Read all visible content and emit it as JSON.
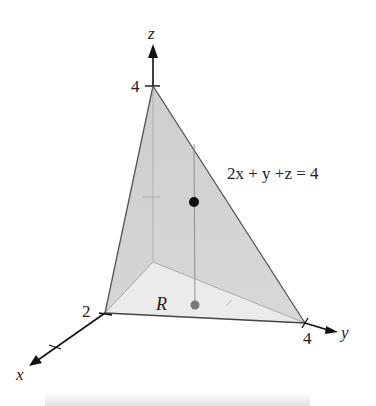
{
  "figure": {
    "type": "3d-solid-region",
    "axes": {
      "x": {
        "label": "x",
        "intercept_label": "2"
      },
      "y": {
        "label": "y",
        "intercept_label": "4"
      },
      "z": {
        "label": "z",
        "intercept_label": "4"
      }
    },
    "plane_equation": "2x + y +z = 4",
    "region_label": "R",
    "points": [
      {
        "name": "point-on-plane",
        "color": "#111111"
      },
      {
        "name": "point-in-region",
        "color": "#777777"
      }
    ],
    "colors": {
      "left_face": "#b5b5b5",
      "front_face": "#d2d2d2",
      "base_region": "#ebebeb",
      "edges": "#555555",
      "axes": "#111111"
    }
  }
}
